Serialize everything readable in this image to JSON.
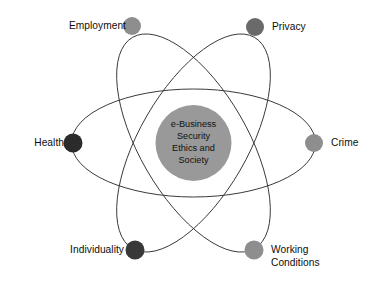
{
  "diagram": {
    "type": "atom-orbit-diagram",
    "canvas": {
      "width": 388,
      "height": 294,
      "background": "#ffffff"
    },
    "core": {
      "name": "core-circle",
      "cx": 193.5,
      "cy": 143,
      "r": 38,
      "color": "#999999",
      "lines": [
        "e-Business",
        "Security",
        "Ethics and",
        "Society"
      ]
    },
    "orbits": [
      {
        "name": "orbit-horizontal",
        "rx": 122,
        "ry": 54,
        "rotation": 0,
        "stroke": "#3a3a3a"
      },
      {
        "name": "orbit-rotated-right",
        "rx": 122,
        "ry": 54,
        "rotation": 60,
        "stroke": "#3a3a3a"
      },
      {
        "name": "orbit-rotated-left",
        "rx": 122,
        "ry": 54,
        "rotation": -60,
        "stroke": "#3a3a3a"
      }
    ],
    "nodes": [
      {
        "id": "employment",
        "label": "Employment",
        "cx": 132,
        "cy": 26,
        "r": 9,
        "color": "#8e8e8e",
        "label_side": "left",
        "label_x": 56,
        "label_y": 20
      },
      {
        "id": "privacy",
        "label": "Privacy",
        "cx": 255,
        "cy": 27,
        "r": 9,
        "color": "#6a6a6a",
        "label_side": "right",
        "label_x": 272,
        "label_y": 21
      },
      {
        "id": "health",
        "label": "Health",
        "cx": 73,
        "cy": 143,
        "r": 9.5,
        "color": "#2b2b2b",
        "label_side": "left",
        "label_x": 22,
        "label_y": 137
      },
      {
        "id": "crime",
        "label": "Crime",
        "cx": 314,
        "cy": 143,
        "r": 9,
        "color": "#8e8e8e",
        "label_side": "right",
        "label_x": 331,
        "label_y": 137
      },
      {
        "id": "individuality",
        "label": "Individuality",
        "cx": 135,
        "cy": 250,
        "r": 9.5,
        "color": "#383838",
        "label_side": "left",
        "label_x": 62,
        "label_y": 244
      },
      {
        "id": "working-conditions",
        "label": "Working\nConditions",
        "cx": 254,
        "cy": 250,
        "r": 9.5,
        "color": "#8e8e8e",
        "label_side": "right",
        "label_x": 271,
        "label_y": 244
      }
    ]
  }
}
